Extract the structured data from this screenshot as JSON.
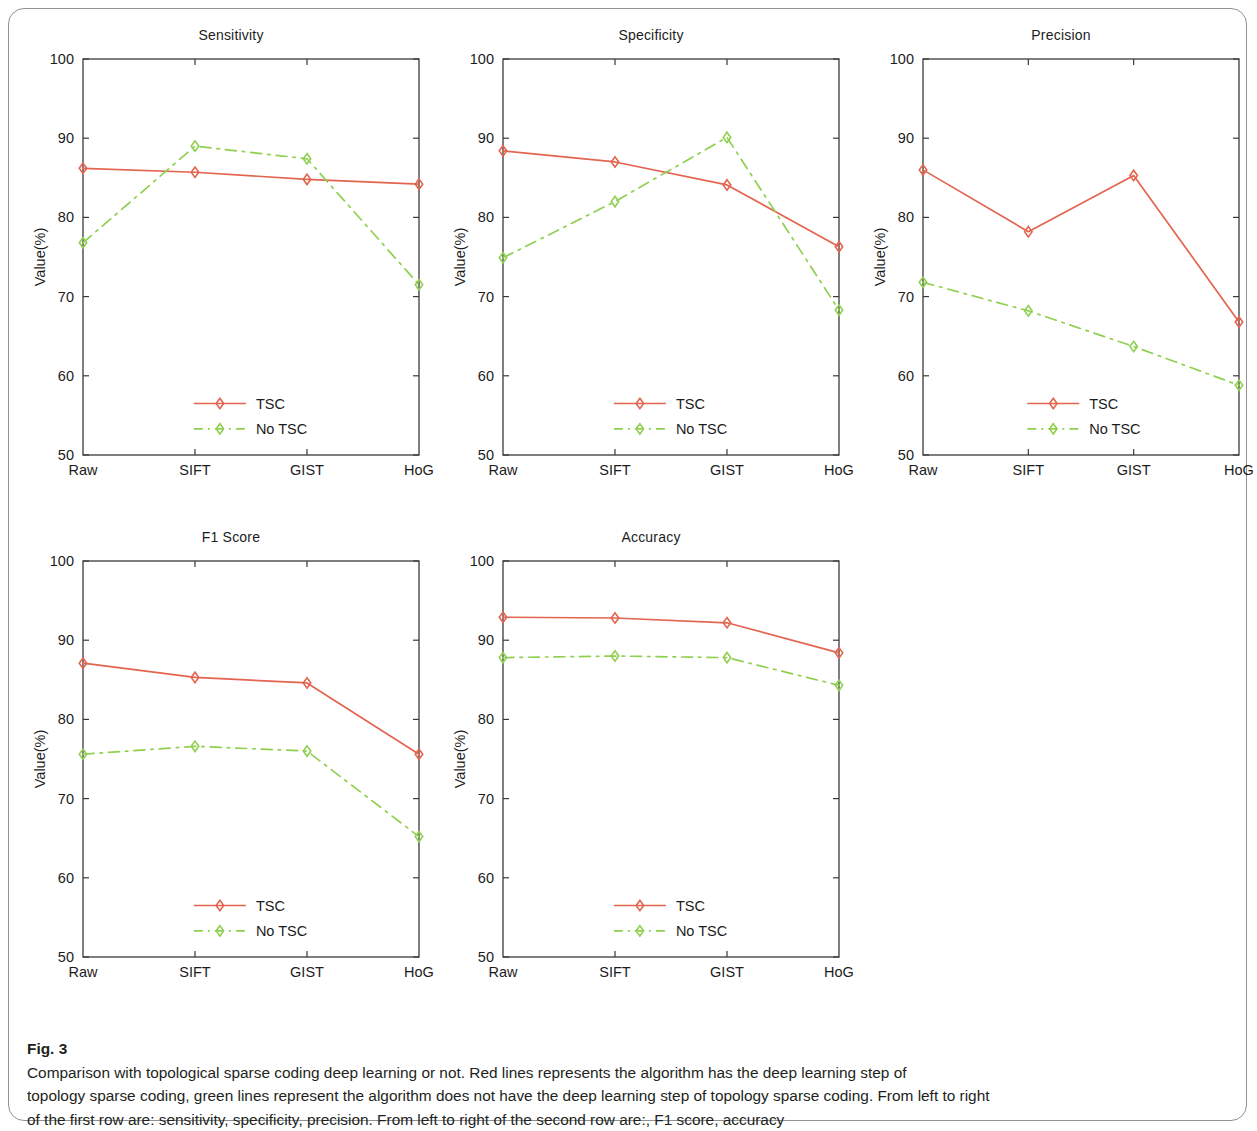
{
  "figure": {
    "caption_label": "Fig. 3",
    "caption_text": " Comparison with topological sparse coding deep learning or not. Red lines represents the algorithm has the deep learning step of topology sparse coding, green lines represent the algorithm does not have the deep learning step of topology sparse coding. From left to right of the first row are: sensitivity, specificity, precision. From left to right of the second row are:, F1 score, accuracy",
    "caption_line_1": " Comparison with topological sparse coding deep learning or not. Red lines represents the algorithm has the deep learning step of",
    "caption_line_2": "topology sparse coding, green lines represent the algorithm does not have the deep learning step of topology sparse coding. From left to right",
    "caption_line_3": "of the first row are: sensitivity, specificity, precision. From left to right of the second row are:, F1 score, accuracy"
  },
  "colors": {
    "tsc": "#e3644f",
    "no_tsc": "#90d050",
    "axis": "#3a3a3a",
    "text": "#1c1c1c",
    "frame": "#8f9296"
  },
  "axis": {
    "y_label": "Value(%)",
    "y_ticks": [
      "50",
      "60",
      "70",
      "80",
      "90",
      "100"
    ],
    "y_tick_values": [
      50,
      60,
      70,
      80,
      90,
      100
    ],
    "x_ticks": [
      "Raw",
      "SIFT",
      "GIST",
      "HoG"
    ],
    "ylim": [
      50,
      100
    ]
  },
  "legend": {
    "tsc_label": "TSC",
    "no_tsc_label": "No TSC"
  },
  "chart_data": [
    {
      "type": "line",
      "title": "Sensitivity",
      "xlabel": "",
      "ylabel": "Value(%)",
      "categories": [
        "Raw",
        "SIFT",
        "GIST",
        "HoG"
      ],
      "ylim": [
        50,
        100
      ],
      "grid": false,
      "legend_position": "inside-bottom-center",
      "series": [
        {
          "name": "TSC",
          "values": [
            86.2,
            85.7,
            84.8,
            84.2
          ]
        },
        {
          "name": "No TSC",
          "values": [
            76.8,
            89.0,
            87.4,
            71.5
          ]
        }
      ]
    },
    {
      "type": "line",
      "title": "Specificity",
      "xlabel": "",
      "ylabel": "Value(%)",
      "categories": [
        "Raw",
        "SIFT",
        "GIST",
        "HoG"
      ],
      "ylim": [
        50,
        100
      ],
      "grid": false,
      "legend_position": "inside-bottom-center",
      "series": [
        {
          "name": "TSC",
          "values": [
            88.4,
            87.0,
            84.1,
            76.3
          ]
        },
        {
          "name": "No TSC",
          "values": [
            74.9,
            82.0,
            90.1,
            68.3
          ]
        }
      ]
    },
    {
      "type": "line",
      "title": "Precision",
      "xlabel": "",
      "ylabel": "Value(%)",
      "categories": [
        "Raw",
        "SIFT",
        "GIST",
        "HoG"
      ],
      "ylim": [
        50,
        100
      ],
      "grid": false,
      "legend_position": "inside-bottom-center",
      "series": [
        {
          "name": "TSC",
          "values": [
            86.0,
            78.2,
            85.3,
            66.8
          ]
        },
        {
          "name": "No TSC",
          "values": [
            71.8,
            68.2,
            63.7,
            58.8
          ]
        }
      ]
    },
    {
      "type": "line",
      "title": "F1 Score",
      "xlabel": "",
      "ylabel": "Value(%)",
      "categories": [
        "Raw",
        "SIFT",
        "GIST",
        "HoG"
      ],
      "ylim": [
        50,
        100
      ],
      "grid": false,
      "legend_position": "inside-bottom-center",
      "series": [
        {
          "name": "TSC",
          "values": [
            87.1,
            85.3,
            84.6,
            75.6
          ]
        },
        {
          "name": "No TSC",
          "values": [
            75.6,
            76.6,
            76.0,
            65.2
          ]
        }
      ]
    },
    {
      "type": "line",
      "title": "Accuracy",
      "xlabel": "",
      "ylabel": "Value(%)",
      "categories": [
        "Raw",
        "SIFT",
        "GIST",
        "HoG"
      ],
      "ylim": [
        50,
        100
      ],
      "grid": false,
      "legend_position": "inside-bottom-center",
      "series": [
        {
          "name": "TSC",
          "values": [
            92.9,
            92.8,
            92.2,
            88.4
          ]
        },
        {
          "name": "No TSC",
          "values": [
            87.8,
            88.0,
            87.8,
            84.3
          ]
        }
      ]
    }
  ]
}
